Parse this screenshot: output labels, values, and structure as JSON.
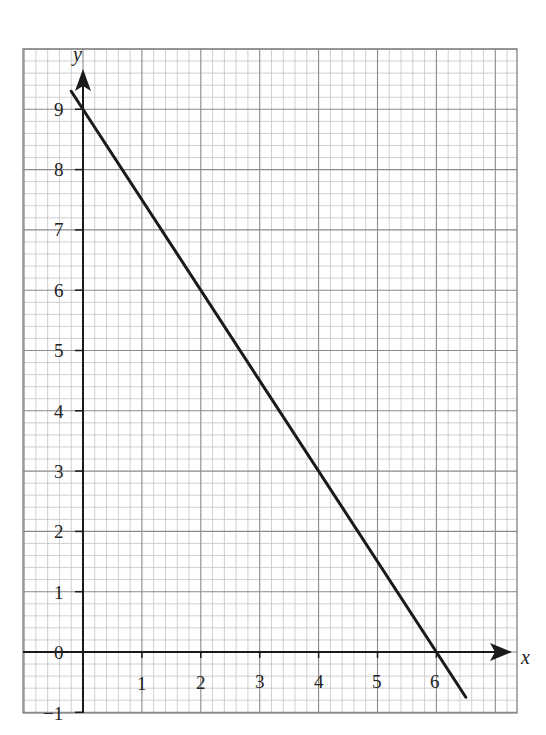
{
  "chart_data": {
    "type": "line",
    "title": "",
    "xlabel": "x",
    "ylabel": "y",
    "xlim": [
      -1,
      7.35
    ],
    "ylim": [
      -1,
      10
    ],
    "grid": true,
    "grid_minor_step": 0.2,
    "x_ticks": [
      "1",
      "2",
      "3",
      "4",
      "5",
      "6"
    ],
    "y_ticks": [
      "-1",
      "0",
      "1",
      "2",
      "3",
      "4",
      "5",
      "6",
      "7",
      "8",
      "9"
    ],
    "series": [
      {
        "name": "y = 9 - 1.5x",
        "x": [
          -0.2,
          6.5
        ],
        "y": [
          9.3,
          -0.75
        ],
        "equation": "y = 9 - 1.5x"
      }
    ],
    "colors": {
      "line": "#1a1a1a",
      "grid_major": "#8a8a8a",
      "grid_minor": "#c4c4c4",
      "axis": "#1a1a1a"
    }
  },
  "labels": {
    "x_axis": "x",
    "y_axis": "y",
    "x_ticks": [
      "1",
      "2",
      "3",
      "4",
      "5",
      "6"
    ],
    "y_ticks": [
      "9",
      "8",
      "7",
      "6",
      "5",
      "4",
      "3",
      "2",
      "1",
      "0",
      "−1"
    ]
  }
}
